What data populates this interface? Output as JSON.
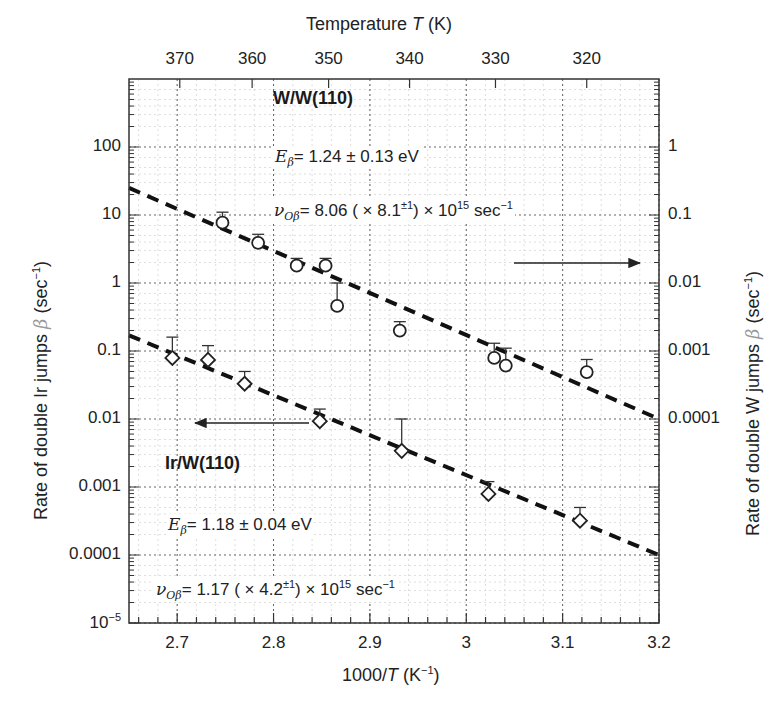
{
  "chart_data": {
    "type": "scatter",
    "title": "",
    "xlabel": "1000/T (K⁻¹)",
    "ylabel": "Rate of double Ir jumps β (sec⁻¹)",
    "ylabel_right": "Rate of double W jumps β (sec⁻¹)",
    "xlabel_top": "Temperature T (K)",
    "xlim": [
      2.65,
      3.2
    ],
    "ylim": [
      1e-05,
      1000
    ],
    "ylim_right": [
      1e-07,
      10
    ],
    "yscale": "log",
    "grid": true,
    "x_ticks": [
      2.7,
      2.8,
      2.9,
      3.0,
      3.1,
      3.2
    ],
    "x_tick_labels": [
      "2.7",
      "2.8",
      "2.9",
      "3",
      "3.1",
      "3.2"
    ],
    "top_ticks_K": [
      370,
      360,
      350,
      340,
      330,
      320
    ],
    "top_tick_labels": [
      "370",
      "360",
      "350",
      "340",
      "330",
      "320"
    ],
    "y_ticks_left": [
      100,
      10,
      1,
      0.1,
      0.01,
      0.001,
      0.0001,
      1e-05
    ],
    "y_tick_labels_left": [
      "100",
      "10",
      "1",
      "0.1",
      "0.01",
      "0.001",
      "0.0001",
      "10⁻⁵"
    ],
    "y_ticks_right": [
      1,
      0.1,
      0.01,
      0.001,
      0.0001
    ],
    "y_tick_labels_right": [
      "1",
      "0.1",
      "0.01",
      "0.001",
      "0.0001"
    ],
    "series": [
      {
        "name": "W/W(110)",
        "marker": "circle",
        "axis": "right",
        "x": [
          2.747,
          2.784,
          2.824,
          2.854,
          2.866,
          2.931,
          3.029,
          3.041,
          3.125
        ],
        "y_right": [
          0.077,
          0.039,
          0.018,
          0.018,
          0.0046,
          0.002,
          0.00079,
          0.00061,
          0.00049
        ],
        "y_left_equiv": [
          7.7,
          3.9,
          1.8,
          1.8,
          0.46,
          0.2,
          0.079,
          0.061,
          0.049
        ],
        "err_upper_left_equiv": [
          11,
          5.2,
          2.3,
          2.3,
          1.0,
          0.27,
          0.13,
          0.11,
          0.075
        ]
      },
      {
        "name": "Ir/W(110)",
        "marker": "diamond",
        "axis": "left",
        "x": [
          2.695,
          2.732,
          2.77,
          2.848,
          2.933,
          3.023,
          3.118
        ],
        "y": [
          0.079,
          0.074,
          0.033,
          0.0093,
          0.0034,
          0.00079,
          0.00032
        ],
        "err_upper": [
          0.16,
          0.12,
          0.05,
          0.014,
          0.01,
          0.0012,
          0.0005
        ]
      }
    ],
    "fit_lines": [
      {
        "name": "W/W(110) fit",
        "style": "dashed",
        "x": [
          2.65,
          3.2
        ],
        "y_left_equiv": [
          25,
          0.01
        ]
      },
      {
        "name": "Ir/W(110) fit",
        "style": "dashed",
        "x": [
          2.65,
          3.2
        ],
        "y": [
          0.17,
          0.0001
        ]
      }
    ],
    "annotations": [
      {
        "text": "W/W(110)",
        "bold": true
      },
      {
        "text": "Eβ = 1.24 ± 0.13 eV"
      },
      {
        "text": "νOβ = 8.06 (× 8.1±¹) × 10¹⁵ sec⁻¹"
      },
      {
        "text": "Ir/W(110)",
        "bold": true
      },
      {
        "text": "Eβ = 1.18 ± 0.04 eV"
      },
      {
        "text": "νOβ = 1.17 (× 4.2±¹) × 10¹⁵ sec⁻¹"
      }
    ],
    "arrows": [
      {
        "series": "W/W(110)",
        "direction": "right",
        "meaning": "use right axis"
      },
      {
        "series": "Ir/W(110)",
        "direction": "left",
        "meaning": "use left axis"
      }
    ]
  },
  "labels": {
    "top_axis_title_a": "Temperature ",
    "top_axis_title_T": "T",
    "top_axis_title_b": " (K)",
    "x_title_a": "1000/",
    "x_title_T": "T",
    "x_title_b": " (K",
    "x_title_sup": "−1",
    "x_title_c": ")",
    "left_title_a": "Rate of double Ir jumps ",
    "left_title_beta": "β",
    "left_title_b": " (sec",
    "left_title_sup": "−1",
    "left_title_c": ")",
    "right_title_a": "Rate of double W jumps ",
    "right_title_beta": "β",
    "right_title_b": " (sec",
    "right_title_sup": "−1",
    "right_title_c": ")",
    "ww_label": "W/W(110)",
    "irw_label": "Ir/W(110)",
    "ww_E_sym": "E",
    "ww_E_sub": "β",
    "ww_E_val": "= 1.24 ± 0.13 eV",
    "ww_nu_sym": "ν",
    "ww_nu_sub": "Oβ",
    "ww_nu_val": "= 8.06 ( × 8.1",
    "ww_nu_sup": "±1",
    "ww_nu_tail": ") × 10",
    "ww_nu_exp": "15",
    "ww_nu_unit": " sec",
    "ww_nu_unit_sup": "−1",
    "ir_E_sym": "E",
    "ir_E_sub": "β",
    "ir_E_val": "= 1.18 ± 0.04 eV",
    "ir_nu_sym": "ν",
    "ir_nu_sub": "Oβ",
    "ir_nu_val": "= 1.17 ( × 4.2",
    "ir_nu_sup": "±1",
    "ir_nu_tail": ") × 10",
    "ir_nu_exp": "15",
    "ir_nu_unit": " sec",
    "ir_nu_unit_sup": "−1",
    "y_exp_base": "10",
    "y_exp_sup": "−5"
  }
}
